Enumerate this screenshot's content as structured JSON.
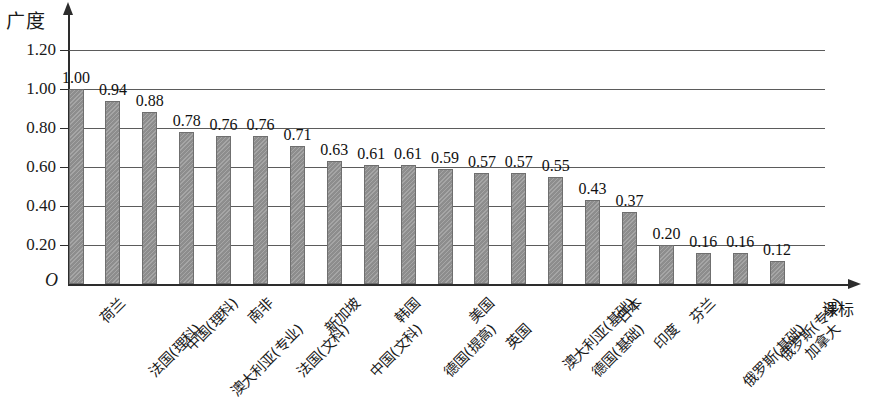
{
  "chart_data": {
    "type": "bar",
    "title": "",
    "ylabel": "广度",
    "xlabel": "课标",
    "origin_label": "O",
    "ylim": [
      0,
      1.3
    ],
    "yticks": [
      0.2,
      0.4,
      0.6,
      0.8,
      1.0,
      1.2
    ],
    "ytick_labels": [
      "0.20",
      "0.40",
      "0.60",
      "0.80",
      "1.00",
      "1.20"
    ],
    "grid": true,
    "legend": "none",
    "bar_color": "#8d8d8d",
    "axis_color": "#2d2d2d",
    "categories": [
      "荷兰",
      "法国(理科)",
      "中国(理科)",
      "澳大利亚(专业)",
      "南非",
      "法国(文科)",
      "新加坡",
      "中国(文科)",
      "韩国",
      "德国(提高)",
      "美国",
      "英国",
      "澳大利亚(基础)",
      "德国(基础)",
      "日本",
      "印度",
      "芬兰",
      "俄罗斯(基础)",
      "俄罗斯(专业)",
      "加拿大"
    ],
    "values": [
      1.0,
      0.94,
      0.88,
      0.78,
      0.76,
      0.76,
      0.71,
      0.63,
      0.61,
      0.61,
      0.59,
      0.57,
      0.57,
      0.55,
      0.43,
      0.37,
      0.2,
      0.16,
      0.16,
      0.12
    ],
    "value_labels": [
      "1.00",
      "0.94",
      "0.88",
      "0.78",
      "0.76",
      "0.76",
      "0.71",
      "0.63",
      "0.61",
      "0.61",
      "0.59",
      "0.57",
      "0.57",
      "0.55",
      "0.43",
      "0.37",
      "0.20",
      "0.16",
      "0.16",
      "0.12"
    ]
  }
}
